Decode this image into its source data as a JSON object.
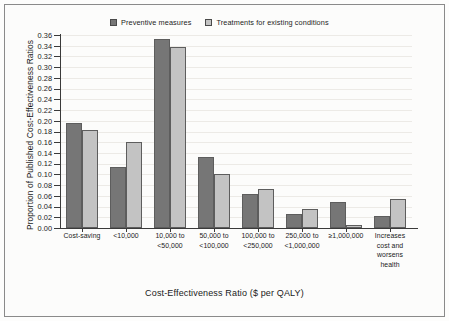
{
  "chart_data": {
    "type": "bar",
    "title": "",
    "xlabel": "Cost-Effectiveness Ratio ($ per QALY)",
    "ylabel": "Proportion of Published Cost-Effectiveness Ratios",
    "ylim": [
      0.0,
      0.36
    ],
    "ytick_step": 0.02,
    "grid": true,
    "legend_position": "top",
    "categories": [
      "Cost-saving",
      "<10,000",
      "10,000 to\n<50,000",
      "50,000 to\n<100,000",
      "100,000 to\n<250,000",
      "250,000 to\n<1,000,000",
      "≥1,000,000",
      "Increases\ncost and\nworsens\nhealth"
    ],
    "category_lines": [
      [
        "Cost-saving"
      ],
      [
        "<10,000"
      ],
      [
        "10,000 to",
        "<50,000"
      ],
      [
        "50,000 to",
        "<100,000"
      ],
      [
        "100,000 to",
        "<250,000"
      ],
      [
        "250,000 to",
        "<1,000,000"
      ],
      [
        "≥1,000,000"
      ],
      [
        "Increases",
        "cost and",
        "worsens",
        "health"
      ]
    ],
    "ytick_labels": [
      "0.00",
      "0.02",
      "0.04",
      "0.06",
      "0.08",
      "0.10",
      "0.12",
      "0.14",
      "0.16",
      "0.18",
      "0.20",
      "0.22",
      "0.24",
      "0.26",
      "0.28",
      "0.30",
      "0.32",
      "0.34",
      "0.36"
    ],
    "ytick_values": [
      0.0,
      0.02,
      0.04,
      0.06,
      0.08,
      0.1,
      0.12,
      0.14,
      0.16,
      0.18,
      0.2,
      0.22,
      0.24,
      0.26,
      0.28,
      0.3,
      0.32,
      0.34,
      0.36
    ],
    "series": [
      {
        "name": "Preventive measures",
        "color": "#767676",
        "values": [
          0.195,
          0.113,
          0.353,
          0.133,
          0.064,
          0.027,
          0.048,
          0.022
        ]
      },
      {
        "name": "Treatments for existing conditions",
        "color": "#c3c3c3",
        "values": [
          0.183,
          0.16,
          0.338,
          0.1,
          0.073,
          0.035,
          0.006,
          0.055
        ]
      }
    ]
  },
  "legend": {
    "items": [
      {
        "label": "Preventive measures",
        "color": "#767676"
      },
      {
        "label": "Treatments for existing conditions",
        "color": "#c3c3c3"
      }
    ]
  }
}
